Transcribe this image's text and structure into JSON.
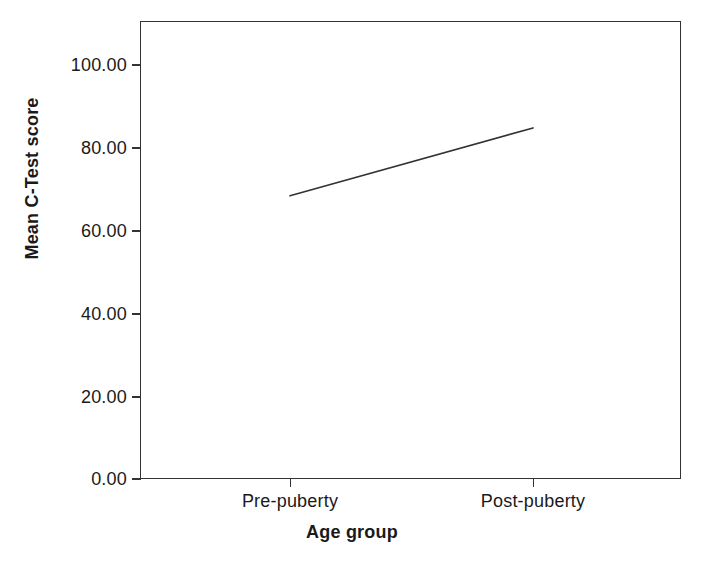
{
  "chart_data": {
    "type": "line",
    "title": "",
    "subtitle": "",
    "xlabel": "Age group",
    "ylabel": "Mean C-Test score",
    "categories": [
      "Pre-puberty",
      "Post-puberty"
    ],
    "series": [
      {
        "name": "Mean C-Test score",
        "values": [
          68.4,
          84.8
        ]
      }
    ],
    "x": [
      0,
      1
    ],
    "ylim": [
      0,
      110
    ],
    "yticks": [
      0,
      20,
      40,
      60,
      80,
      100
    ],
    "ytick_labels": [
      "0.00",
      "20.00",
      "40.00",
      "60.00",
      "80.00",
      "100.00"
    ],
    "xtick_labels": [
      "Pre-puberty",
      "Post-puberty"
    ],
    "grid": false,
    "legend": false,
    "legend_position": "none",
    "line_color": "#333333",
    "frame_color": "#333333",
    "background": "#ffffff",
    "markers": false
  },
  "figure": {
    "y_axis_title": "Mean C-Test score",
    "x_axis_title": "Age group",
    "y_tick_labels": [
      "100.00",
      "80.00",
      "60.00",
      "40.00",
      "20.00",
      "0.00"
    ],
    "x_tick_labels": [
      "Pre-puberty",
      "Post-puberty"
    ]
  }
}
